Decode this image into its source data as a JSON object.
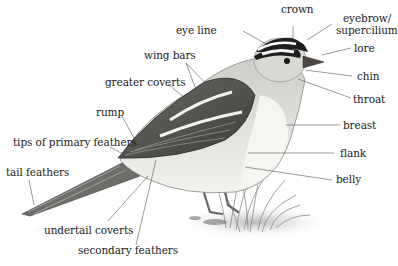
{
  "diagram": {
    "labels": {
      "crown": "crown",
      "eyebrow_1": "eyebrow/",
      "eyebrow_2": "supercilium",
      "eye_line": "eye line",
      "lore": "lore",
      "wing_bars": "wing bars",
      "chin": "chin",
      "greater_coverts": "greater coverts",
      "throat": "throat",
      "rump": "rump",
      "breast": "breast",
      "tips_primary": "tips of primary feathers",
      "flank": "flank",
      "tail_feathers": "tail feathers",
      "belly": "belly",
      "undertail_coverts": "undertail coverts",
      "secondary_feathers": "secondary feathers"
    },
    "colors": {
      "ink": "#222222",
      "leader": "#555555",
      "body_light": "#e6e4e0",
      "body_mid": "#a8a6a2",
      "wing_dark": "#5a5855",
      "head_black": "#1e1e1e"
    }
  }
}
